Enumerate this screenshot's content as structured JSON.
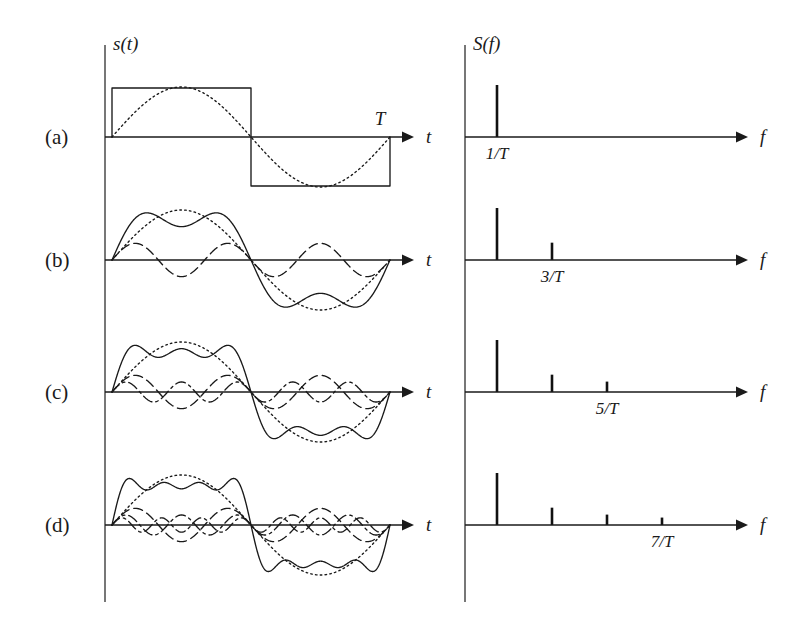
{
  "figure": {
    "background": "#ffffff",
    "ink": "#1a1a1a",
    "left_panel": {
      "axis_y_label": "s(t)",
      "axis_x_label": "t",
      "period_label": "T"
    },
    "right_panel": {
      "axis_y_label": "S(f)",
      "axis_x_label": "f"
    }
  },
  "rows": [
    {
      "label": "(a)",
      "tick_label": "1/T",
      "harmonics": [
        1
      ],
      "show_square": true,
      "show_sum": false,
      "spectrum_lines": 1
    },
    {
      "label": "(b)",
      "tick_label": "3/T",
      "harmonics": [
        1,
        3
      ],
      "show_square": false,
      "show_sum": true,
      "spectrum_lines": 2
    },
    {
      "label": "(c)",
      "tick_label": "5/T",
      "harmonics": [
        1,
        3,
        5
      ],
      "show_square": false,
      "show_sum": true,
      "spectrum_lines": 3
    },
    {
      "label": "(d)",
      "tick_label": "7/T",
      "harmonics": [
        1,
        3,
        5,
        7
      ],
      "show_square": false,
      "show_sum": true,
      "spectrum_lines": 4
    }
  ],
  "chart_data": {
    "type": "line",
    "xlabel": "t",
    "ylabel": "s(t)",
    "panels": [
      {
        "row": "(a)",
        "time_domain": {
          "xlabel": "t",
          "ylabel": "s(t)",
          "period_marker": "T",
          "series": [
            {
              "name": "square wave",
              "style": "solid",
              "harmonic": 0,
              "amplitude": 1.0
            },
            {
              "name": "fundamental 1/T",
              "style": "dotted",
              "harmonic": 1,
              "amplitude": 1.0
            }
          ]
        },
        "spectrum": {
          "xlabel": "f",
          "ylabel": "S(f)",
          "x": [
            "1/T"
          ],
          "values": [
            1.0
          ],
          "tick_label": "1/T"
        }
      },
      {
        "row": "(b)",
        "time_domain": {
          "xlabel": "t",
          "ylabel": "s(t)",
          "series": [
            {
              "name": "fundamental 1/T",
              "style": "dotted",
              "harmonic": 1,
              "amplitude": 1.0
            },
            {
              "name": "3rd harmonic 3/T",
              "style": "dashed",
              "harmonic": 3,
              "amplitude": 0.3333
            },
            {
              "name": "sum",
              "style": "solid",
              "harmonic": 0,
              "amplitude": 1.0
            }
          ]
        },
        "spectrum": {
          "xlabel": "f",
          "ylabel": "S(f)",
          "x": [
            "1/T",
            "3/T"
          ],
          "values": [
            1.0,
            0.3333
          ],
          "tick_label": "3/T"
        }
      },
      {
        "row": "(c)",
        "time_domain": {
          "xlabel": "t",
          "ylabel": "s(t)",
          "series": [
            {
              "name": "fundamental 1/T",
              "style": "dotted",
              "harmonic": 1,
              "amplitude": 1.0
            },
            {
              "name": "3rd harmonic 3/T",
              "style": "dashed",
              "harmonic": 3,
              "amplitude": 0.3333
            },
            {
              "name": "5th harmonic 5/T",
              "style": "dashdot",
              "harmonic": 5,
              "amplitude": 0.2
            },
            {
              "name": "sum",
              "style": "solid",
              "harmonic": 0,
              "amplitude": 1.0
            }
          ]
        },
        "spectrum": {
          "xlabel": "f",
          "ylabel": "S(f)",
          "x": [
            "1/T",
            "3/T",
            "5/T"
          ],
          "values": [
            1.0,
            0.3333,
            0.2
          ],
          "tick_label": "5/T"
        }
      },
      {
        "row": "(d)",
        "time_domain": {
          "xlabel": "t",
          "ylabel": "s(t)",
          "series": [
            {
              "name": "fundamental 1/T",
              "style": "dotted",
              "harmonic": 1,
              "amplitude": 1.0
            },
            {
              "name": "3rd harmonic 3/T",
              "style": "dashed",
              "harmonic": 3,
              "amplitude": 0.3333
            },
            {
              "name": "5th harmonic 5/T",
              "style": "dashdot",
              "harmonic": 5,
              "amplitude": 0.2
            },
            {
              "name": "7th harmonic 7/T",
              "style": "dashdot",
              "harmonic": 7,
              "amplitude": 0.1429
            },
            {
              "name": "sum",
              "style": "solid",
              "harmonic": 0,
              "amplitude": 1.0
            }
          ]
        },
        "spectrum": {
          "xlabel": "f",
          "ylabel": "S(f)",
          "x": [
            "1/T",
            "3/T",
            "5/T",
            "7/T"
          ],
          "values": [
            1.0,
            0.3333,
            0.2,
            0.1429
          ],
          "tick_label": "7/T"
        }
      }
    ],
    "axis_ranges": {
      "t": [
        0,
        1
      ],
      "f_units": "1/T"
    },
    "grid": false,
    "legend": "none"
  },
  "geometry": {
    "left_axis_x": 105,
    "left_axis_top": 45,
    "left_axis_bottom": 602,
    "right_axis_x": 465,
    "time_start_x": 112,
    "time_end_x": 390,
    "t_arrow_end_x": 414,
    "f_start_x": 465,
    "f_arrow_end_x": 748,
    "spike_start_x": 497,
    "spike_spacing": 55,
    "spike_max_height": 52,
    "baselines": [
      137,
      260,
      392,
      525
    ],
    "wave_amplitude": 50,
    "label_x": 45
  }
}
